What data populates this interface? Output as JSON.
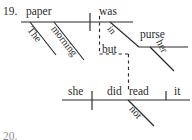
{
  "page": {
    "item_number": "19.",
    "next_item_number": "20."
  },
  "diagram": {
    "type": "reed-kellogg-sentence-diagram",
    "sentence": "The morning paper was in her purse, but she did not read it.",
    "clauses": [
      {
        "name": "main-clause-1",
        "subject": "paper",
        "verb": "was",
        "modifiers": [
          "The",
          "morning"
        ],
        "prepositional_phrase": {
          "preposition": "in",
          "object": "purse",
          "object_modifier": "her"
        }
      },
      {
        "name": "main-clause-2",
        "subject": "she",
        "verb": "did read",
        "object": "it",
        "adverb": "not"
      }
    ],
    "conjunction": "but"
  },
  "words": {
    "paper": "paper",
    "was": "was",
    "the": "The",
    "morning": "morning",
    "in": "in",
    "purse": "purse",
    "her": "her",
    "but": "but",
    "she": "she",
    "did": "did",
    "read": "read",
    "not": "not",
    "it": "it"
  },
  "colors": {
    "ink": "#2b2b2b",
    "faint_ink": "#8d8d8d",
    "background": "#ffffff"
  }
}
